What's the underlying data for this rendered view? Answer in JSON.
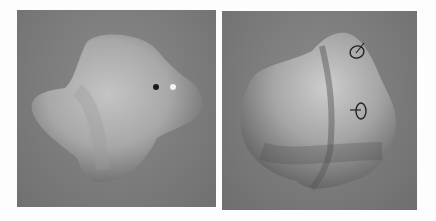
{
  "figure": {
    "panels": [
      {
        "id": "left",
        "description": "Rendered smooth blob-like 3D shape with two point markers",
        "markers": [
          {
            "type": "dot",
            "color": "#1a1a1a"
          },
          {
            "type": "dot",
            "color": "#f2f2f2"
          }
        ]
      },
      {
        "id": "right",
        "description": "Rendered smooth blob-like 3D shape with two circle-and-tick glyph markers",
        "markers": [
          {
            "type": "circle-glyph",
            "color": "#222222"
          },
          {
            "type": "circle-glyph",
            "color": "#222222"
          }
        ]
      }
    ],
    "colors": {
      "background": "#fdfdfd",
      "panel_bg": "#7b7b7b",
      "shape_light": "#cfcfcf",
      "shape_dark": "#5a5a5a"
    }
  }
}
